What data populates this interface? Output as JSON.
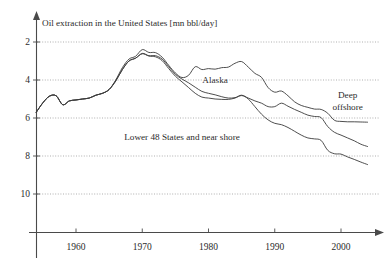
{
  "chart_data": {
    "type": "line",
    "title": "Oil extraction in the United States [mn bbl/day]",
    "xlabel": "",
    "ylabel": "mn bbl/day",
    "xlim": [
      1954,
      2004
    ],
    "ylim": [
      0,
      11
    ],
    "grid": true,
    "legend_position": "inline-annotations",
    "yticks": [
      2,
      4,
      6,
      8,
      10
    ],
    "xticks": [
      1960,
      1970,
      1980,
      1990,
      2000
    ],
    "annotations": [
      {
        "text": "Alaska",
        "x": 1981,
        "y": 8.0
      },
      {
        "text": "Deep",
        "x": 2001,
        "y": 7.2
      },
      {
        "text": "offshore",
        "x": 2001,
        "y": 6.6
      },
      {
        "text": "Lower 48 States and near shore",
        "x": 1976,
        "y": 5.0
      }
    ],
    "series": [
      {
        "name": "Total (Lower 48 + Alaska + Deep offshore)",
        "x": [
          1954,
          1955,
          1956,
          1957,
          1958,
          1959,
          1960,
          1961,
          1962,
          1963,
          1964,
          1965,
          1966,
          1967,
          1968,
          1969,
          1970,
          1971,
          1972,
          1973,
          1974,
          1975,
          1976,
          1977,
          1978,
          1979,
          1980,
          1981,
          1982,
          1983,
          1984,
          1985,
          1986,
          1987,
          1988,
          1989,
          1990,
          1991,
          1992,
          1993,
          1994,
          1995,
          1996,
          1997,
          1998,
          1999,
          2000,
          2001,
          2002,
          2003,
          2004
        ],
        "values": [
          6.3,
          6.8,
          7.15,
          7.17,
          6.7,
          6.9,
          6.95,
          7.0,
          7.05,
          7.2,
          7.3,
          7.5,
          8.0,
          8.65,
          9.1,
          9.25,
          9.6,
          9.45,
          9.44,
          9.2,
          8.77,
          8.37,
          8.13,
          8.25,
          8.7,
          8.55,
          8.6,
          8.57,
          8.65,
          8.68,
          8.88,
          8.97,
          8.68,
          8.35,
          8.14,
          7.6,
          7.36,
          7.42,
          7.17,
          6.85,
          6.66,
          6.56,
          6.47,
          6.45,
          6.25,
          5.88,
          5.82,
          5.8,
          5.8,
          5.79,
          5.78
        ]
      },
      {
        "name": "Lower 48 + Alaska (below Deep offshore)",
        "x": [
          1954,
          1955,
          1956,
          1957,
          1958,
          1959,
          1960,
          1961,
          1962,
          1963,
          1964,
          1965,
          1966,
          1967,
          1968,
          1969,
          1970,
          1971,
          1972,
          1973,
          1974,
          1975,
          1976,
          1977,
          1978,
          1979,
          1980,
          1981,
          1982,
          1983,
          1984,
          1985,
          1986,
          1987,
          1988,
          1989,
          1990,
          1991,
          1992,
          1993,
          1994,
          1995,
          1996,
          1997,
          1998,
          1999,
          2000,
          2001,
          2002,
          2003,
          2004
        ],
        "values": [
          6.3,
          6.8,
          7.15,
          7.17,
          6.7,
          6.9,
          6.95,
          7.0,
          7.05,
          7.2,
          7.3,
          7.5,
          7.95,
          8.55,
          9.0,
          9.15,
          9.4,
          9.28,
          9.28,
          9.1,
          8.7,
          8.3,
          8.05,
          7.85,
          7.62,
          7.4,
          7.3,
          7.22,
          7.12,
          7.05,
          7.07,
          7.18,
          7.05,
          6.9,
          6.78,
          6.6,
          6.6,
          6.78,
          6.62,
          6.45,
          6.3,
          6.15,
          6.08,
          6.02,
          5.55,
          5.25,
          5.1,
          4.95,
          4.8,
          4.62,
          4.5
        ]
      },
      {
        "name": "Lower 48 States and near shore",
        "x": [
          1954,
          1955,
          1956,
          1957,
          1958,
          1959,
          1960,
          1961,
          1962,
          1963,
          1964,
          1965,
          1966,
          1967,
          1968,
          1969,
          1970,
          1971,
          1972,
          1973,
          1974,
          1975,
          1976,
          1977,
          1978,
          1979,
          1980,
          1981,
          1982,
          1983,
          1984,
          1985,
          1986,
          1987,
          1988,
          1989,
          1990,
          1991,
          1992,
          1993,
          1994,
          1995,
          1996,
          1997,
          1998,
          1999,
          2000,
          2001,
          2002,
          2003,
          2004
        ],
        "values": [
          6.3,
          6.8,
          7.15,
          7.17,
          6.7,
          6.9,
          6.95,
          7.0,
          7.05,
          7.2,
          7.3,
          7.5,
          7.95,
          8.55,
          9.0,
          9.15,
          9.38,
          9.26,
          9.22,
          9.02,
          8.6,
          8.2,
          7.9,
          7.6,
          7.3,
          7.1,
          7.05,
          7.0,
          6.98,
          6.98,
          7.05,
          7.2,
          7.0,
          6.6,
          6.2,
          5.9,
          5.72,
          5.65,
          5.5,
          5.3,
          5.1,
          4.95,
          4.9,
          4.82,
          4.3,
          4.12,
          4.1,
          3.95,
          3.82,
          3.68,
          3.55
        ]
      }
    ]
  },
  "axes": {
    "ytick_labels": [
      "10",
      "8",
      "6",
      "4",
      "2"
    ],
    "xtick_labels": [
      "1960",
      "1970",
      "1980",
      "1990",
      "2000"
    ]
  },
  "colors": {
    "curve": "#3a3a3a",
    "grid": "#8c8c8c",
    "axis": "#4a4a4a",
    "text": "#2b2b2b",
    "background": "#ffffff"
  }
}
